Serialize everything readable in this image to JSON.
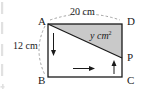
{
  "figure": {
    "type": "geometry-diagram",
    "colors": {
      "stroke": "#1a1a1a",
      "shade_fill": "#c9c9c9",
      "dashed": "#9a9a9a",
      "background": "#ffffff"
    },
    "vertices": [
      {
        "name": "A",
        "label": "A",
        "x": 48,
        "y": 24
      },
      {
        "name": "D",
        "label": "D",
        "x": 122,
        "y": 24
      },
      {
        "name": "B",
        "label": "B",
        "x": 48,
        "y": 77
      },
      {
        "name": "C",
        "label": "C",
        "x": 122,
        "y": 77
      },
      {
        "name": "P",
        "label": "P",
        "x": 122,
        "y": 58
      }
    ],
    "vertex_labels": {
      "A": "A",
      "B": "B",
      "C": "C",
      "D": "D",
      "P": "P"
    },
    "dimensions": {
      "top_label": "20 cm",
      "left_label": "12 cm"
    },
    "shaded_area_label": "y cm",
    "shaded_area_exponent": "2",
    "arrows": [
      {
        "name": "arrow-down-left",
        "direction": "down"
      },
      {
        "name": "arrow-right-bottom",
        "direction": "right"
      },
      {
        "name": "arrow-up-right",
        "direction": "up"
      }
    ]
  }
}
